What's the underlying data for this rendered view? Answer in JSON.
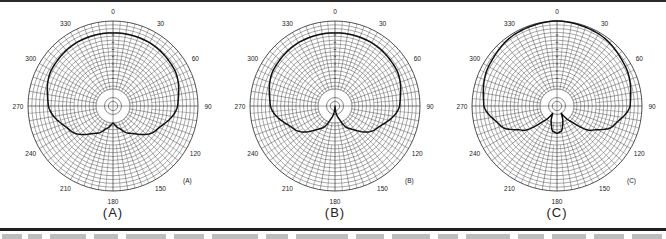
{
  "chart_data": [
    {
      "type": "polar",
      "panel": "A",
      "title": "(A)",
      "corner_label": "(A)",
      "angle_ticks": [
        "0",
        "30",
        "60",
        "90",
        "120",
        "150",
        "180",
        "210",
        "240",
        "270",
        "300",
        "330"
      ],
      "angle_grid_step_deg": 10,
      "radial_scale": "dB (logarithmic rings, labels illegible)",
      "pattern_description": "wide subcardioid, shallow rear dip",
      "pattern_radius_fraction": {
        "angles_deg": [
          0,
          30,
          60,
          90,
          120,
          150,
          165,
          180
        ],
        "r": [
          0.86,
          0.86,
          0.84,
          0.76,
          0.58,
          0.37,
          0.27,
          0.2
        ]
      }
    },
    {
      "type": "polar",
      "panel": "B",
      "title": "(B)",
      "corner_label": "(B)",
      "angle_ticks": [
        "0",
        "30",
        "60",
        "90",
        "120",
        "150",
        "180",
        "210",
        "240",
        "270",
        "300",
        "330"
      ],
      "angle_grid_step_deg": 10,
      "radial_scale": "dB (logarithmic rings, labels illegible)",
      "pattern_description": "cardioid with rear null at 180",
      "pattern_radius_fraction": {
        "angles_deg": [
          0,
          30,
          60,
          90,
          120,
          150,
          165,
          180
        ],
        "r": [
          0.86,
          0.86,
          0.84,
          0.76,
          0.55,
          0.3,
          0.14,
          0.0
        ]
      }
    },
    {
      "type": "polar",
      "panel": "C",
      "title": "(C)",
      "corner_label": "(C)",
      "angle_ticks": [
        "0",
        "30",
        "60",
        "90",
        "120",
        "150",
        "180",
        "210",
        "240",
        "270",
        "300",
        "330"
      ],
      "angle_grid_step_deg": 10,
      "radial_scale": "dB (logarithmic rings, labels illegible)",
      "pattern_description": "supercardioid with nulls near 150/210 and small rear lobe",
      "pattern_radius_fraction": {
        "angles_deg": [
          0,
          30,
          60,
          90,
          110,
          125,
          140,
          150,
          160,
          170,
          180
        ],
        "r": [
          1.0,
          0.98,
          0.93,
          0.86,
          0.7,
          0.5,
          0.22,
          0.1,
          0.2,
          0.3,
          0.32
        ]
      }
    }
  ],
  "panels": [
    {
      "label": "(A)",
      "corner": "(A)",
      "cx": 113,
      "cy": 106
    },
    {
      "label": "(B)",
      "corner": "(B)",
      "cx": 335,
      "cy": 106
    },
    {
      "label": "(C)",
      "corner": "(C)",
      "cx": 557,
      "cy": 106
    }
  ],
  "outer_radius_px": 85,
  "colors": {
    "grid": "#3a3a3a",
    "pattern": "#111111",
    "text": "#222222",
    "rule": "#1e1e1e"
  }
}
